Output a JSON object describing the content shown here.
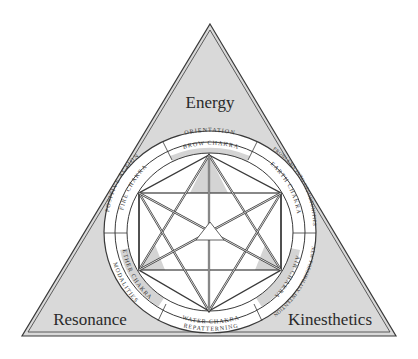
{
  "diagram": {
    "corners": {
      "top": "Energy",
      "bottom_left": "Resonance",
      "bottom_right": "Kinesthetics"
    },
    "outer_ring": {
      "top": "ORIENTATION",
      "upper_right": "PROBLEMS INTO OPPORTUNITIES",
      "lower_right": "NEW POSSIBILITY INTENTION",
      "bottom": "REPATTERNING",
      "lower_left": "MODALITIES",
      "upper_left": "POSITIVE ACTION"
    },
    "inner_ring": {
      "top": "BROW CHAKRA",
      "upper_right": "EARTH CHAKRA",
      "lower_right": "AIR CHAKRA",
      "bottom": "WATER CHAKRA",
      "lower_left": "ETHER CHAKRA",
      "upper_left": "FIRE CHAKRA"
    },
    "colors": {
      "triangle_fill": "#d9d9d9",
      "line": "#3a3a3a",
      "shade": "#d4d4d4",
      "white": "#ffffff"
    }
  }
}
